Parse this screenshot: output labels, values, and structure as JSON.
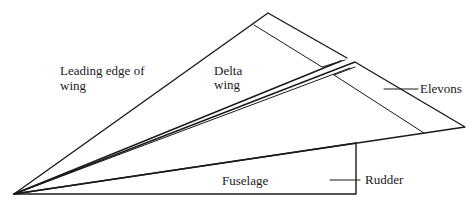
{
  "diagram": {
    "colors": {
      "line": "#1a1a1a",
      "background": "#ffffff"
    },
    "labels": {
      "leading_edge_line1": "Leading edge of",
      "leading_edge_line2": "wing",
      "delta_wing_line1": "Delta",
      "delta_wing_line2": "wing",
      "elevons": "Elevons",
      "fuselage": "Fuselage",
      "rudder": "Rudder"
    }
  }
}
